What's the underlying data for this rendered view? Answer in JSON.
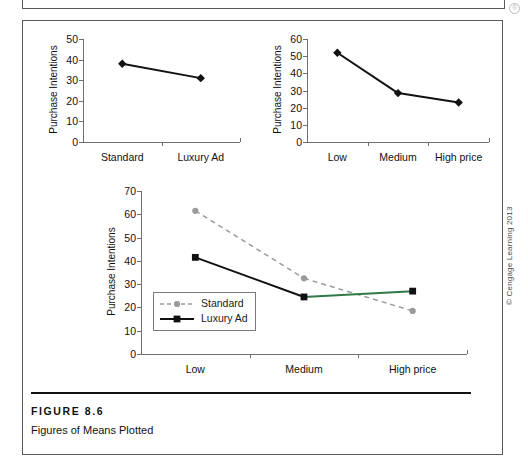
{
  "page": {
    "copyright": "© Cengage Learning 2013",
    "corner_glyph": "registered-mark"
  },
  "caption": {
    "figure_number": "FIGURE 8.6",
    "figure_title": "Figures of Means Plotted"
  },
  "chart_data": [
    {
      "id": "chart-ad-type",
      "type": "line",
      "title": "",
      "xlabel": "",
      "ylabel": "Purchase Intentions",
      "categories": [
        "Standard",
        "Luxury Ad"
      ],
      "values": [
        38,
        31
      ],
      "ylim": [
        0,
        50
      ],
      "yticks": [
        0,
        10,
        20,
        30,
        40,
        50
      ],
      "grid": false,
      "legend": null,
      "marker": "diamond",
      "color": "#111111",
      "line_style": "solid"
    },
    {
      "id": "chart-price",
      "type": "line",
      "title": "",
      "xlabel": "",
      "ylabel": "Purchase Intentions",
      "categories": [
        "Low",
        "Medium",
        "High price"
      ],
      "values": [
        52,
        28.5,
        23
      ],
      "ylim": [
        0,
        60
      ],
      "yticks": [
        0,
        10,
        20,
        30,
        40,
        50,
        60
      ],
      "grid": false,
      "legend": null,
      "marker": "diamond",
      "color": "#111111",
      "line_style": "solid"
    },
    {
      "id": "chart-interaction",
      "type": "line",
      "title": "",
      "xlabel": "",
      "ylabel": "Purchase Intentions",
      "categories": [
        "Low",
        "Medium",
        "High price"
      ],
      "ylim": [
        0,
        70
      ],
      "yticks": [
        0,
        10,
        20,
        30,
        40,
        50,
        60,
        70
      ],
      "grid": false,
      "legend_position": "bottom-left",
      "series": [
        {
          "name": "Standard",
          "values": [
            61.5,
            32.5,
            18.5
          ],
          "color": "#9a9a9a",
          "line_style": "dashed",
          "marker": "circle"
        },
        {
          "name": "Luxury Ad",
          "values": [
            41.5,
            24.5,
            27
          ],
          "color": "#111111",
          "line_style": "solid",
          "marker": "square"
        }
      ]
    }
  ]
}
